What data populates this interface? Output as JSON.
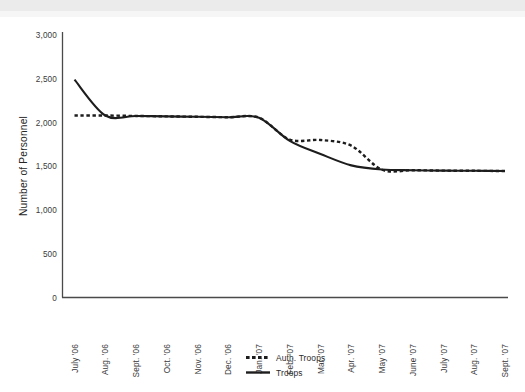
{
  "chart_data": {
    "type": "line",
    "title": "",
    "xlabel": "",
    "ylabel": "Number of Personnel",
    "ylim": [
      0,
      3000
    ],
    "ytick_values": [
      0,
      500,
      1000,
      1500,
      2000,
      2500,
      3000
    ],
    "ytick_labels": [
      "0",
      "500",
      "1,000",
      "1,500",
      "2,000",
      "2,500",
      "3,000"
    ],
    "grid": false,
    "legend_position": "bottom-center",
    "categories": [
      "July '06",
      "Aug. '06",
      "Sept. '06",
      "Oct. '06",
      "Nov. '06",
      "Dec. '06",
      "Jan. '07",
      "Feb. '07",
      "Mar. '07",
      "Apr. '07",
      "May '07",
      "June '07",
      "July '07",
      "Aug. '07",
      "Sept. '07"
    ],
    "series": [
      {
        "name": "Auth. Troops",
        "style": "dashed",
        "color": "#1d1d1d",
        "values": [
          2080,
          2080,
          2075,
          2070,
          2065,
          2060,
          2055,
          1805,
          1800,
          1735,
          1460,
          1455,
          1450,
          1448,
          1445
        ]
      },
      {
        "name": "Troops",
        "style": "solid",
        "color": "#1d1d1d",
        "values": [
          2490,
          2080,
          2075,
          2070,
          2065,
          2060,
          2055,
          1790,
          1640,
          1510,
          1462,
          1455,
          1450,
          1448,
          1445
        ]
      }
    ]
  },
  "legend": {
    "entries": [
      {
        "label": "Auth. Troops",
        "style": "dashed"
      },
      {
        "label": "Troops",
        "style": "solid"
      }
    ]
  },
  "axes": {
    "y_title": "Number of Personnel"
  }
}
